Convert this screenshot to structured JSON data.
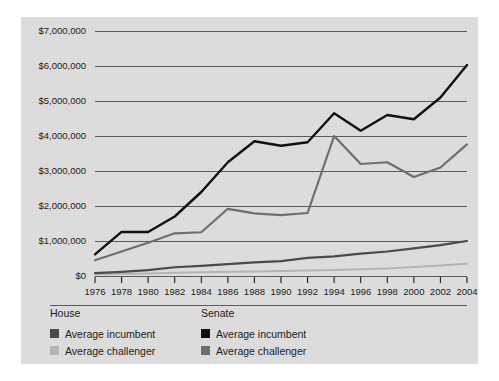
{
  "chart_data": {
    "type": "line",
    "title": "",
    "xlabel": "",
    "ylabel": "",
    "x": [
      1976,
      1978,
      1980,
      1982,
      1984,
      1986,
      1988,
      1990,
      1992,
      1994,
      1996,
      1998,
      2000,
      2002,
      2004
    ],
    "categories": [
      "1976",
      "1978",
      "1980",
      "1982",
      "1984",
      "1986",
      "1988",
      "1990",
      "1992",
      "1994",
      "1996",
      "1998",
      "2000",
      "2002",
      "2004"
    ],
    "ylim": [
      0,
      7000000
    ],
    "ytick_values": [
      0,
      1000000,
      2000000,
      3000000,
      4000000,
      5000000,
      6000000,
      7000000
    ],
    "ytick_labels": [
      "$0",
      "$1,000,000",
      "$2,000,000",
      "$3,000,000",
      "$4,000,000",
      "$5,000,000",
      "$6,000,000",
      "$7,000,000"
    ],
    "grid": true,
    "legend_position": "below-axis",
    "series": [
      {
        "name": "Senate Average incumbent",
        "group": "Senate",
        "label": "Average incumbent",
        "color": "#111111",
        "width": 2.4,
        "values": [
          620000,
          1260000,
          1255000,
          1700000,
          2400000,
          3250000,
          3850000,
          3720000,
          3820000,
          4650000,
          4150000,
          4600000,
          4480000,
          5100000,
          6030000
        ]
      },
      {
        "name": "Senate Average challenger",
        "group": "Senate",
        "label": "Average challenger",
        "color": "#6e6e6e",
        "width": 2.2,
        "values": [
          450000,
          700000,
          950000,
          1220000,
          1250000,
          1920000,
          1790000,
          1740000,
          1800000,
          4000000,
          3200000,
          3250000,
          2830000,
          3100000,
          3760000
        ]
      },
      {
        "name": "House Average incumbent",
        "group": "House",
        "label": "Average incumbent",
        "color": "#4a4a4a",
        "width": 2.2,
        "values": [
          80000,
          120000,
          170000,
          250000,
          290000,
          340000,
          390000,
          425000,
          520000,
          560000,
          640000,
          700000,
          790000,
          880000,
          1000000
        ]
      },
      {
        "name": "House Average challenger",
        "group": "House",
        "label": "Average challenger",
        "color": "#b4b4b4",
        "width": 2.0,
        "values": [
          50000,
          60000,
          75000,
          90000,
          105000,
          120000,
          130000,
          140000,
          155000,
          175000,
          190000,
          215000,
          255000,
          300000,
          350000
        ]
      }
    ]
  },
  "legend": {
    "groups": [
      {
        "title": "House",
        "entries": [
          {
            "label": "Average incumbent",
            "color": "#4a4a4a"
          },
          {
            "label": "Average challenger",
            "color": "#b4b4b4"
          }
        ]
      },
      {
        "title": "Senate",
        "entries": [
          {
            "label": "Average incumbent",
            "color": "#111111"
          },
          {
            "label": "Average challenger",
            "color": "#6e6e6e"
          }
        ]
      }
    ]
  },
  "colors": {
    "panel_background": "#dcdcdc",
    "page_background": "#ffffff",
    "gridline": "#4d4d4d",
    "text": "#1a1a1a"
  }
}
